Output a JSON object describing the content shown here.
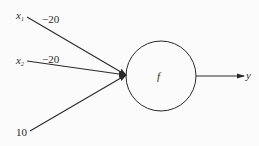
{
  "diagram": {
    "type": "perceptron-neuron",
    "inputs": [
      {
        "id": "x1",
        "label": "x",
        "subscript": "1",
        "weight": "−20"
      },
      {
        "id": "x2",
        "label": "x",
        "subscript": "2",
        "weight": "−20"
      },
      {
        "id": "bias",
        "label": "10",
        "subscript": "",
        "weight": ""
      }
    ],
    "node": {
      "label": "f"
    },
    "output": {
      "label": "y"
    },
    "colors": {
      "stroke": "#2a2a2a",
      "background": "#fbfbfb"
    }
  }
}
